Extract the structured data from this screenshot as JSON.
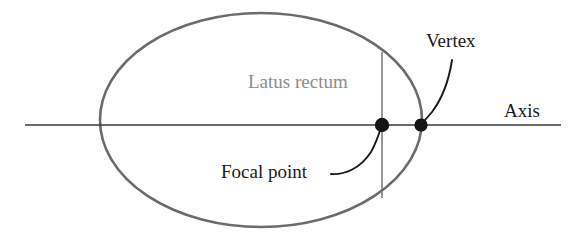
{
  "figure": {
    "kind": "geometry-diagram",
    "background_color": "#ffffff",
    "width": 574,
    "height": 241
  },
  "colors": {
    "ellipse_stroke": "#6b6b6b",
    "axis_stroke": "#3a3a3a",
    "latus_rectum_stroke": "#6b6b6b",
    "leader_stroke": "#1a1a1a",
    "point_fill": "#141414",
    "label_dark": "#1a1a1a",
    "label_gray": "#8c8c8c"
  },
  "geometry": {
    "ellipse": {
      "center_x": 261,
      "center_y": 120,
      "radius_x": 161,
      "radius_y": 107,
      "stroke_width": 2.6
    },
    "axis_line": {
      "x1": 25,
      "y1": 125,
      "x2": 561,
      "y2": 125,
      "stroke_width": 1.3
    },
    "latus_rectum_line": {
      "x": 382,
      "y1": 52,
      "y2": 198,
      "stroke_width": 1.4
    },
    "focal_point": {
      "cx": 382,
      "cy": 125,
      "r": 7.2
    },
    "vertex_point": {
      "cx": 421,
      "cy": 125,
      "r": 6.6
    },
    "vertex_leader": {
      "path": "M 452 60 C 449 80, 444 96, 432 112 C 428 117, 425 120, 422 123",
      "stroke_width": 1.9
    },
    "focal_leader": {
      "path": "M 331 174 C 344 175, 360 169, 371 152 C 376 143, 379 134, 381 127",
      "stroke_width": 1.9
    }
  },
  "labels": {
    "latus_rectum": {
      "text": "Latus rectum",
      "x": 248,
      "y": 69,
      "font_size": 19,
      "color_key": "label_gray"
    },
    "vertex": {
      "text": "Vertex",
      "x": 426,
      "y": 28,
      "font_size": 19,
      "color_key": "label_dark"
    },
    "focal_point": {
      "text": "Focal point",
      "x": 221,
      "y": 159,
      "font_size": 19,
      "color_key": "label_dark"
    },
    "axis": {
      "x": 504,
      "y": 98,
      "text": "Axis",
      "font_size": 19,
      "color_key": "label_dark"
    }
  },
  "icon_names": {
    "focal_point_marker": "filled-dot-icon",
    "vertex_point_marker": "filled-dot-icon",
    "vertex_leader": "curved-leader-line-icon",
    "focal_leader": "curved-leader-line-icon"
  }
}
